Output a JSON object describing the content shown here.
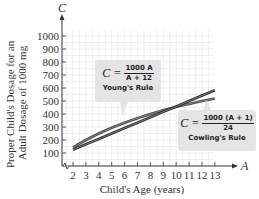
{
  "chart_data": {
    "type": "line",
    "title": "",
    "xlabel": "Child's Age (years)",
    "ylabel": "Proper Child's Dosage for an Adult Dosage of 1000 mg",
    "x_axis_var": "A",
    "y_axis_var": "C",
    "x": [
      2,
      3,
      4,
      5,
      6,
      7,
      8,
      9,
      10,
      11,
      12,
      13
    ],
    "xticks": [
      "2",
      "3",
      "4",
      "5",
      "6",
      "7",
      "8",
      "9",
      "10",
      "11",
      "12",
      "13"
    ],
    "yticks": [
      "100",
      "200",
      "300",
      "400",
      "500",
      "600",
      "700",
      "800",
      "900",
      "1000"
    ],
    "xlim": [
      1,
      13
    ],
    "ylim": [
      0,
      1000
    ],
    "grid": true,
    "axis_break": true,
    "series": [
      {
        "name": "Young's Rule",
        "formula": "C = 1000A / (A + 12)",
        "values": [
          143,
          200,
          250,
          294,
          333,
          368,
          400,
          429,
          455,
          478,
          500,
          520
        ],
        "color": "#4a4a4a"
      },
      {
        "name": "Cowling's Rule",
        "formula": "C = 1000(A + 1) / 24",
        "values": [
          125,
          167,
          208,
          250,
          292,
          333,
          375,
          417,
          458,
          500,
          542,
          583
        ],
        "color": "#2e2e2e"
      }
    ],
    "annotations": [
      {
        "label": "Young's Rule",
        "lhs": "C =",
        "numerator": "1000 A",
        "denominator": "A + 12"
      },
      {
        "label": "Cowling's Rule",
        "lhs": "C =",
        "numerator": "1000 (A + 1)",
        "denominator": "24"
      }
    ]
  },
  "colors": {
    "grid": "#e6e6e6",
    "axis": "#333333",
    "box_bg": "#e4e4e4"
  }
}
